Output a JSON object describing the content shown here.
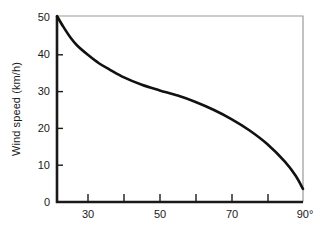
{
  "chart_data": {
    "type": "line",
    "title": "",
    "xlabel": "Angle fishing line makes with protractor",
    "ylabel": "Wind speed (km/h)",
    "xlim": [
      21.3,
      90
    ],
    "ylim": [
      0,
      50
    ],
    "grid": false,
    "legend": null,
    "x_tick_labels": [
      "30",
      "50",
      "70",
      "90°"
    ],
    "x_tick_values": [
      30,
      50,
      70,
      90
    ],
    "x_minor_tick_values": [
      40,
      60,
      80
    ],
    "y_tick_labels": [
      "0",
      "10",
      "20",
      "30",
      "40",
      "50"
    ],
    "y_tick_values": [
      0,
      10,
      20,
      30,
      40,
      50
    ],
    "series": [
      {
        "name": "wind speed",
        "x": [
          21.3,
          23,
          25,
          27,
          30,
          33,
          36,
          40,
          45,
          50,
          55,
          60,
          65,
          70,
          75,
          80,
          85,
          88,
          90
        ],
        "values": [
          50.0,
          47.2,
          44.3,
          42.0,
          39.5,
          37.3,
          35.6,
          33.5,
          31.5,
          30.0,
          28.6,
          26.9,
          24.8,
          22.3,
          19.3,
          15.6,
          10.8,
          7.0,
          3.5
        ]
      }
    ],
    "curve_color": "#111111",
    "axis_color": "#1a1a1a",
    "frame_color": "#9a9a9a",
    "background": "#ffffff"
  },
  "figure": {
    "axis_title_y": "Wind speed (km/h)",
    "axis_title_x": "Angle fishing line makes with protractor"
  }
}
